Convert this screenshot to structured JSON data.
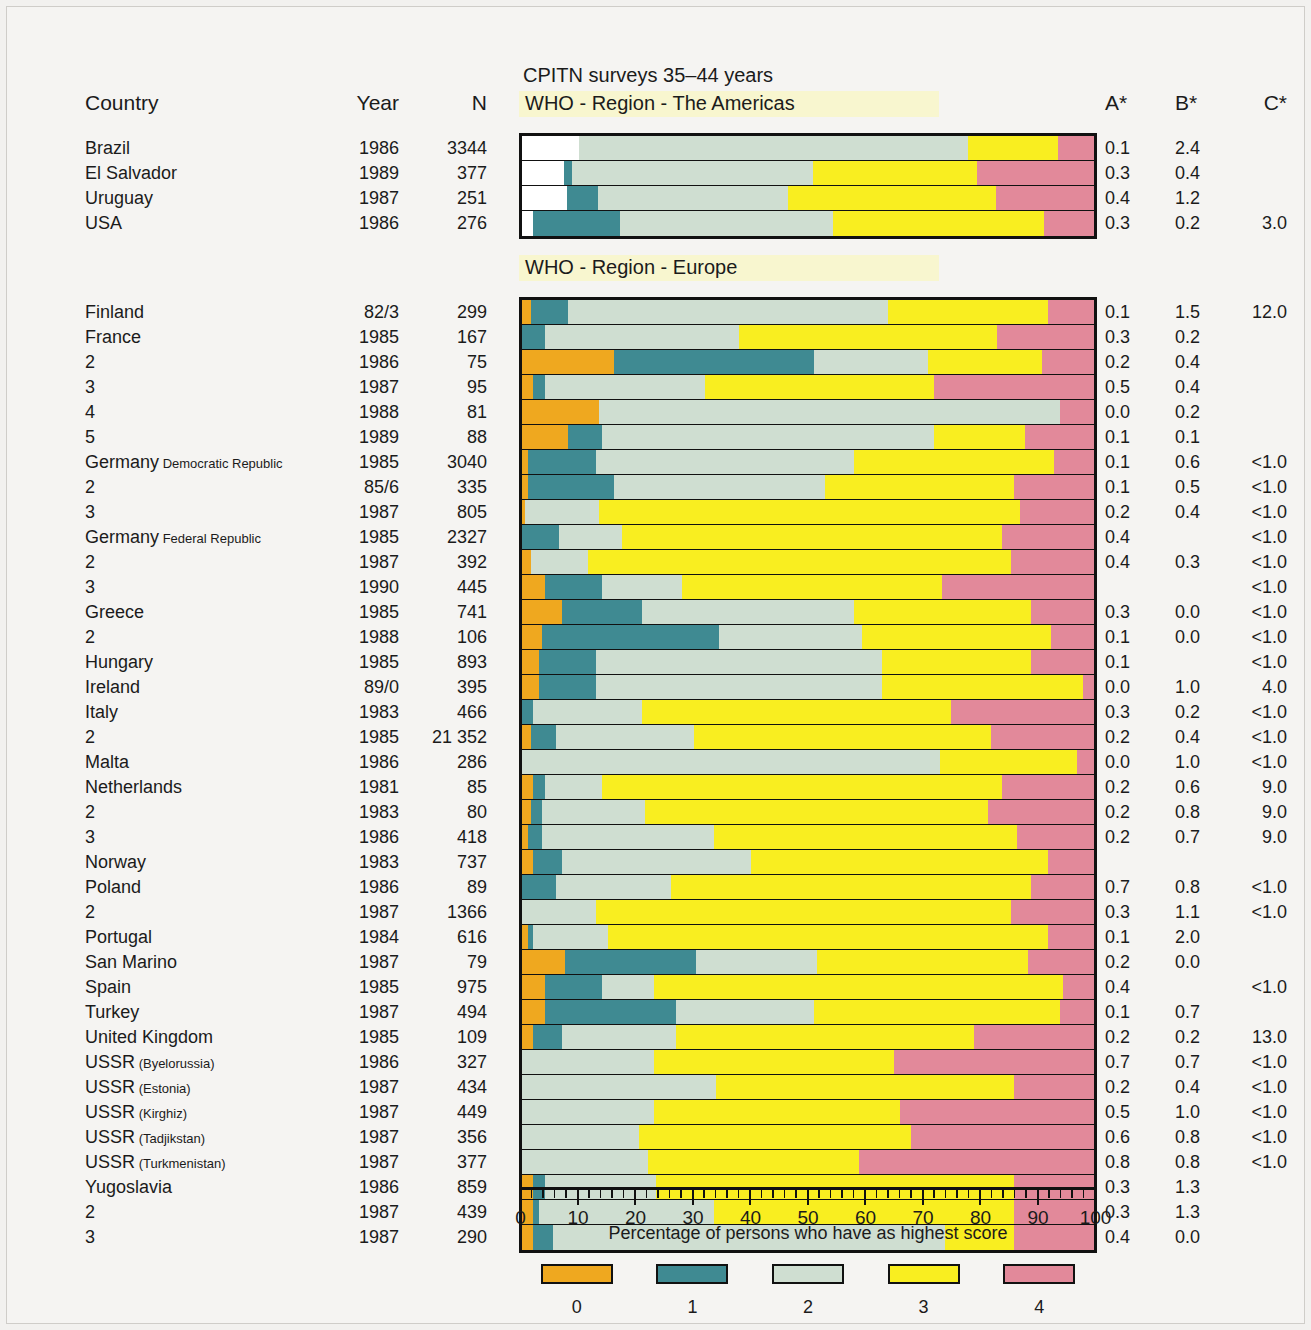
{
  "chart_data": {
    "type": "bar",
    "subtype": "horizontal stacked 100% bar",
    "title": "CPITN surveys 35–44 years",
    "xlabel": "Percentage of persons who have as highest score",
    "ylabel": "",
    "xlim": [
      0,
      100
    ],
    "xticks": [
      0,
      10,
      20,
      30,
      40,
      50,
      60,
      70,
      80,
      90,
      100
    ],
    "minor_tick_step": 2,
    "grid": false,
    "legend_position": "bottom",
    "legend": {
      "title": "CPITN score",
      "entries": [
        {
          "label": "0",
          "color": "#efa81f"
        },
        {
          "label": "1",
          "color": "#3f8a92"
        },
        {
          "label": "2",
          "color": "#cfded1"
        },
        {
          "label": "3",
          "color": "#f9ee20"
        },
        {
          "label": "4",
          "color": "#e2899a"
        }
      ]
    },
    "series_names": [
      "0",
      "1",
      "2",
      "3",
      "4"
    ],
    "columns": [
      "Country",
      "Year",
      "N",
      "A*",
      "B*",
      "C*"
    ],
    "groups": [
      {
        "region": "WHO - Region - The Americas",
        "rows": [
          {
            "country": "Brazil",
            "sub": "",
            "year": "1986",
            "n": "3344",
            "a": "0.1",
            "b": "2.4",
            "c": "",
            "values": [
              0,
              0,
              75.5,
              17.5,
              7.0
            ],
            "blank": 11.0
          },
          {
            "country": "El Salvador",
            "sub": "",
            "year": "1989",
            "n": "377",
            "a": "0.3",
            "b": "0.4",
            "c": "",
            "values": [
              0,
              1.5,
              45.5,
              31.0,
              22.0
            ],
            "blank": 8.0
          },
          {
            "country": "Uruguay",
            "sub": "",
            "year": "1987",
            "n": "251",
            "a": "0.4",
            "b": "1.2",
            "c": "",
            "values": [
              0,
              6.0,
              36.0,
              39.5,
              18.5
            ],
            "blank": 8.5
          },
          {
            "country": "USA",
            "sub": "",
            "year": "1986",
            "n": "276",
            "a": "0.3",
            "b": "0.2",
            "c": "3.0",
            "values": [
              0,
              15.5,
              38.0,
              37.5,
              9.0
            ],
            "blank": 2.0
          }
        ]
      },
      {
        "region": "WHO - Region - Europe",
        "rows": [
          {
            "country": "Finland",
            "sub": "",
            "year": "82/3",
            "n": "299",
            "a": "0.1",
            "b": "1.5",
            "c": "12.0",
            "values": [
              1.5,
              6.5,
              56.0,
              28.0,
              8.0
            ]
          },
          {
            "country": "France",
            "sub": "",
            "year": "1985",
            "n": "167",
            "a": "0.3",
            "b": "0.2",
            "c": "",
            "values": [
              0.0,
              4.0,
              34.0,
              45.0,
              17.0
            ]
          },
          {
            "country": "2",
            "sub": "",
            "year": "1986",
            "n": "75",
            "a": "0.2",
            "b": "0.4",
            "c": "",
            "values": [
              16.0,
              35.0,
              20.0,
              20.0,
              9.0
            ]
          },
          {
            "country": "3",
            "sub": "",
            "year": "1987",
            "n": "95",
            "a": "0.5",
            "b": "0.4",
            "c": "",
            "values": [
              2.0,
              2.0,
              28.0,
              40.0,
              28.0
            ]
          },
          {
            "country": "4",
            "sub": "",
            "year": "1988",
            "n": "81",
            "a": "0.0",
            "b": "0.2",
            "c": "",
            "values": [
              13.5,
              0.0,
              80.5,
              0.0,
              6.0
            ]
          },
          {
            "country": "5",
            "sub": "",
            "year": "1989",
            "n": "88",
            "a": "0.1",
            "b": "0.1",
            "c": "",
            "values": [
              8.0,
              6.0,
              58.0,
              16.0,
              12.0
            ]
          },
          {
            "country": "Germany",
            "sub": "Democratic Republic",
            "year": "1985",
            "n": "3040",
            "a": "0.1",
            "b": "0.6",
            "c": "<1.0",
            "values": [
              1.0,
              12.0,
              45.0,
              35.0,
              7.0
            ]
          },
          {
            "country": "2",
            "sub": "",
            "year": "85/6",
            "n": "335",
            "a": "0.1",
            "b": "0.5",
            "c": "<1.0",
            "values": [
              1.0,
              15.0,
              37.0,
              33.0,
              14.0
            ]
          },
          {
            "country": "3",
            "sub": "",
            "year": "1987",
            "n": "805",
            "a": "0.2",
            "b": "0.4",
            "c": "<1.0",
            "values": [
              0.5,
              0.0,
              13.0,
              73.5,
              13.0
            ]
          },
          {
            "country": "Germany",
            "sub": "Federal Republic",
            "year": "1985",
            "n": "2327",
            "a": "0.4",
            "b": "",
            "c": "<1.0",
            "values": [
              0.0,
              6.5,
              11.0,
              66.5,
              16.0
            ]
          },
          {
            "country": "2",
            "sub": "",
            "year": "1987",
            "n": "392",
            "a": "0.4",
            "b": "0.3",
            "c": "<1.0",
            "values": [
              1.5,
              0.0,
              10.0,
              74.0,
              14.5
            ]
          },
          {
            "country": "3",
            "sub": "",
            "year": "1990",
            "n": "445",
            "a": "",
            "b": "",
            "c": "<1.0",
            "values": [
              4.0,
              10.0,
              14.0,
              45.5,
              26.5
            ]
          },
          {
            "country": "Greece",
            "sub": "",
            "year": "1985",
            "n": "741",
            "a": "0.3",
            "b": "0.0",
            "c": "<1.0",
            "values": [
              7.0,
              14.0,
              37.0,
              31.0,
              11.0
            ]
          },
          {
            "country": "2",
            "sub": "",
            "year": "1988",
            "n": "106",
            "a": "0.1",
            "b": "0.0",
            "c": "<1.0",
            "values": [
              3.5,
              31.0,
              25.0,
              33.0,
              7.5
            ]
          },
          {
            "country": "Hungary",
            "sub": "",
            "year": "1985",
            "n": "893",
            "a": "0.1",
            "b": "",
            "c": "<1.0",
            "values": [
              3.0,
              10.0,
              50.0,
              26.0,
              11.0
            ]
          },
          {
            "country": "Ireland",
            "sub": "",
            "year": "89/0",
            "n": "395",
            "a": "0.0",
            "b": "1.0",
            "c": "4.0",
            "values": [
              3.0,
              10.0,
              50.0,
              35.0,
              2.0
            ]
          },
          {
            "country": "Italy",
            "sub": "",
            "year": "1983",
            "n": "466",
            "a": "0.3",
            "b": "0.2",
            "c": "<1.0",
            "values": [
              0.0,
              2.0,
              19.0,
              54.0,
              25.0
            ]
          },
          {
            "country": "2",
            "sub": "",
            "year": "1985",
            "n": "21 352",
            "a": "0.2",
            "b": "0.4",
            "c": "<1.0",
            "values": [
              1.5,
              4.5,
              24.0,
              52.0,
              18.0
            ]
          },
          {
            "country": "Malta",
            "sub": "",
            "year": "1986",
            "n": "286",
            "a": "0.0",
            "b": "1.0",
            "c": "<1.0",
            "values": [
              0.0,
              0.0,
              73.0,
              24.0,
              3.0
            ]
          },
          {
            "country": "Netherlands",
            "sub": "",
            "year": "1981",
            "n": "85",
            "a": "0.2",
            "b": "0.6",
            "c": "9.0",
            "values": [
              2.0,
              2.0,
              10.0,
              70.0,
              16.0
            ]
          },
          {
            "country": "2",
            "sub": "",
            "year": "1983",
            "n": "80",
            "a": "0.2",
            "b": "0.8",
            "c": "9.0",
            "values": [
              1.5,
              2.0,
              18.0,
              60.0,
              18.5
            ]
          },
          {
            "country": "3",
            "sub": "",
            "year": "1986",
            "n": "418",
            "a": "0.2",
            "b": "0.7",
            "c": "9.0",
            "values": [
              1.0,
              2.5,
              30.0,
              53.0,
              13.5
            ]
          },
          {
            "country": "Norway",
            "sub": "",
            "year": "1983",
            "n": "737",
            "a": "",
            "b": "",
            "c": "",
            "values": [
              2.0,
              5.0,
              33.0,
              52.0,
              8.0
            ]
          },
          {
            "country": "Poland",
            "sub": "",
            "year": "1986",
            "n": "89",
            "a": "0.7",
            "b": "0.8",
            "c": "<1.0",
            "values": [
              0.0,
              6.0,
              20.0,
              63.0,
              11.0
            ]
          },
          {
            "country": "2",
            "sub": "",
            "year": "1987",
            "n": "1366",
            "a": "0.3",
            "b": "1.1",
            "c": "<1.0",
            "values": [
              0.0,
              0.0,
              13.0,
              72.5,
              14.5
            ]
          },
          {
            "country": "Portugal",
            "sub": "",
            "year": "1984",
            "n": "616",
            "a": "0.1",
            "b": "2.0",
            "c": "",
            "values": [
              1.0,
              1.0,
              13.0,
              77.0,
              8.0
            ]
          },
          {
            "country": "San Marino",
            "sub": "",
            "year": "1987",
            "n": "79",
            "a": "0.2",
            "b": "0.0",
            "c": "",
            "values": [
              7.5,
              23.0,
              21.0,
              37.0,
              11.5
            ]
          },
          {
            "country": "Spain",
            "sub": "",
            "year": "1985",
            "n": "975",
            "a": "0.4",
            "b": "",
            "c": "<1.0",
            "values": [
              4.0,
              10.0,
              9.0,
              71.5,
              5.5
            ]
          },
          {
            "country": "Turkey",
            "sub": "",
            "year": "1987",
            "n": "494",
            "a": "0.1",
            "b": "0.7",
            "c": "",
            "values": [
              4.0,
              23.0,
              24.0,
              43.0,
              6.0
            ]
          },
          {
            "country": "United Kingdom",
            "sub": "",
            "year": "1985",
            "n": "109",
            "a": "0.2",
            "b": "0.2",
            "c": "13.0",
            "values": [
              2.0,
              5.0,
              20.0,
              52.0,
              21.0
            ]
          },
          {
            "country": "USSR",
            "sub": "(Byelorussia)",
            "year": "1986",
            "n": "327",
            "a": "0.7",
            "b": "0.7",
            "c": "<1.0",
            "values": [
              0.0,
              0.0,
              23.0,
              42.0,
              35.0
            ]
          },
          {
            "country": "USSR",
            "sub": "(Estonia)",
            "year": "1987",
            "n": "434",
            "a": "0.2",
            "b": "0.4",
            "c": "<1.0",
            "values": [
              0.0,
              0.0,
              34.0,
              52.0,
              14.0
            ]
          },
          {
            "country": "USSR",
            "sub": "(Kirghiz)",
            "year": "1987",
            "n": "449",
            "a": "0.5",
            "b": "1.0",
            "c": "<1.0",
            "values": [
              0.0,
              0.0,
              23.0,
              43.0,
              34.0
            ]
          },
          {
            "country": "USSR",
            "sub": "(Tadjikstan)",
            "year": "1987",
            "n": "356",
            "a": "0.6",
            "b": "0.8",
            "c": "<1.0",
            "values": [
              0.0,
              0.0,
              20.5,
              47.5,
              32.0
            ]
          },
          {
            "country": "USSR",
            "sub": "(Turkmenistan)",
            "year": "1987",
            "n": "377",
            "a": "0.8",
            "b": "0.8",
            "c": "<1.0",
            "values": [
              0.0,
              0.0,
              22.0,
              37.0,
              41.0
            ]
          },
          {
            "country": "Yugoslavia",
            "sub": "",
            "year": "1986",
            "n": "859",
            "a": "0.3",
            "b": "1.3",
            "c": "",
            "values": [
              2.0,
              2.0,
              19.5,
              62.5,
              14.0
            ]
          },
          {
            "country": "2",
            "sub": "",
            "year": "1987",
            "n": "439",
            "a": "0.3",
            "b": "1.3",
            "c": "",
            "values": [
              2.0,
              1.0,
              30.5,
              52.5,
              14.0
            ]
          },
          {
            "country": "3",
            "sub": "",
            "year": "1987",
            "n": "290",
            "a": "0.4",
            "b": "0.0",
            "c": "",
            "values": [
              2.0,
              3.5,
              68.5,
              12.0,
              14.0
            ]
          }
        ]
      }
    ]
  },
  "header": {
    "country": "Country",
    "year": "Year",
    "n": "N",
    "a": "A*",
    "b": "B*",
    "c": "C*"
  },
  "title": "CPITN surveys 35–44 years",
  "axis_title": "Percentage of persons who have as highest score",
  "colors": {
    "score0": "#efa81f",
    "score1": "#3f8a92",
    "score2": "#cfded1",
    "score3": "#f9ee20",
    "score4": "#e2899a",
    "region_band": "#f8f6cf",
    "page_background": "#f5f4f2",
    "outline": "#111111"
  }
}
